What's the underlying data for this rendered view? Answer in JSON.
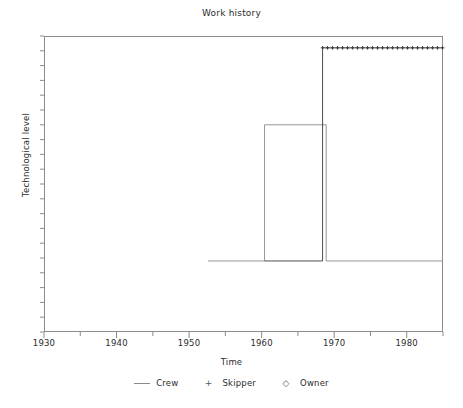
{
  "chart_data": {
    "type": "line",
    "title": "Work history",
    "xlabel": "Time",
    "ylabel": "Technological level",
    "xlim": [
      1930,
      1985
    ],
    "ylim": [
      0,
      10
    ],
    "grid": false,
    "legend_position": "bottom-center",
    "xticks": [
      1930,
      1940,
      1950,
      1960,
      1970,
      1980
    ],
    "xtick_labels": [
      "1930",
      "1940",
      "1950",
      "1960",
      "1970",
      "1980"
    ],
    "xminor_tick_interval": 5,
    "yticks": [],
    "ytick_labels": [],
    "yminor_ticks": 20,
    "series": [
      {
        "name": "Crew",
        "marker": "none",
        "style": "step",
        "color": "#8a8a8a",
        "x": [
          1952.6,
          1960.4,
          1960.4,
          1968.9,
          1968.9,
          1985
        ],
        "y": [
          2.4,
          2.4,
          7.0,
          7.0,
          2.4,
          2.4
        ]
      },
      {
        "name": "Skipper",
        "marker": "+",
        "style": "step",
        "color": "#3a3a3a",
        "x": [
          1960.4,
          1968.4,
          1968.4,
          1985
        ],
        "y": [
          2.4,
          2.4,
          9.6,
          9.6
        ]
      },
      {
        "name": "Owner",
        "marker": "diamond",
        "style": "step",
        "color": "#3a3a3a",
        "x": [],
        "y": []
      }
    ]
  },
  "title": "Work history",
  "axes": {
    "xlabel": "Time",
    "ylabel": "Technological level",
    "xtick_labels": [
      "1930",
      "1940",
      "1950",
      "1960",
      "1970",
      "1980"
    ]
  },
  "legend": {
    "entries": [
      {
        "key": "line",
        "label": "Crew"
      },
      {
        "key": "+",
        "label": "Skipper"
      },
      {
        "key": "◇",
        "label": "Owner"
      }
    ]
  }
}
